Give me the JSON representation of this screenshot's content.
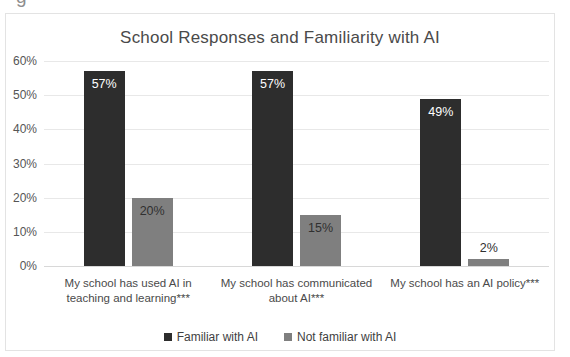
{
  "chart_data": {
    "type": "bar",
    "title": "School Responses and Familiarity with AI",
    "xlabel": "",
    "ylabel": "",
    "ylim": [
      0,
      60
    ],
    "ytick_labels": [
      "0%",
      "10%",
      "20%",
      "30%",
      "40%",
      "50%",
      "60%"
    ],
    "ytick_values": [
      0,
      10,
      20,
      30,
      40,
      50,
      60
    ],
    "grid": true,
    "legend_position": "bottom",
    "categories": [
      "My school has used AI in teaching and learning***",
      "My school has communicated about AI***",
      "My school has an AI policy***"
    ],
    "series": [
      {
        "name": "Familiar with AI",
        "color": "#2d2d2d",
        "values": [
          57,
          57,
          49
        ],
        "data_labels": [
          "57%",
          "57%",
          "49%"
        ]
      },
      {
        "name": "Not familiar with AI",
        "color": "#7f7f7f",
        "values": [
          20,
          15,
          2
        ],
        "data_labels": [
          "20%",
          "15%",
          "2%"
        ]
      }
    ]
  },
  "artifacts": {
    "top_glyph": "g"
  }
}
